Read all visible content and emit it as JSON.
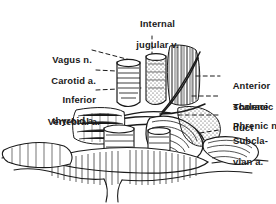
{
  "figure": {
    "kind": "anatomical-line-drawing",
    "background_color": "#ffffff",
    "ink_color": "#1a1a1a"
  },
  "labels": {
    "top": {
      "id": "internal-jugular-vein",
      "line1": "Internal",
      "line2": "jugular v.",
      "leader": "dashed-vertical"
    },
    "left": [
      {
        "id": "vagus-nerve",
        "line1": "Vagus n.",
        "line2": "",
        "leader": "dashed"
      },
      {
        "id": "carotid-artery",
        "line1": "Carotid a.",
        "line2": "",
        "leader": "dashed"
      },
      {
        "id": "inferior-thyroid-artery",
        "line1": "Inferior",
        "line2": "thyroid a.",
        "leader": "dashed"
      },
      {
        "id": "vertebral-artery",
        "line1": "Vertebral a.",
        "line2": "",
        "leader": "dashed"
      }
    ],
    "right": [
      {
        "id": "anterior-scalene",
        "line1": "Anterior",
        "line2": "scalene",
        "leader": "dashed"
      },
      {
        "id": "thoracic-duct",
        "line1": "Thoracic",
        "line2": "duct",
        "leader": "dashed"
      },
      {
        "id": "phrenic-nerve",
        "line1": "Phrenic n.",
        "line2": "",
        "leader": "dashed"
      },
      {
        "id": "subclavian-artery",
        "line1": "Subcla-",
        "line2": "vian a.",
        "leader": "dashed"
      }
    ]
  }
}
